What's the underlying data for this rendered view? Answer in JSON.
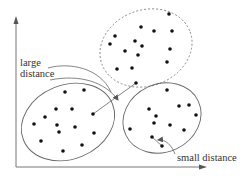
{
  "diagram": {
    "type": "clustering-distance-illustration",
    "colors": {
      "axis": "#777777",
      "ellipse": "#666666",
      "dashed_ellipse": "#888888",
      "point": "#111111",
      "text": "#333333"
    },
    "labels": {
      "large_distance_line1": "large",
      "large_distance_line2": "distance",
      "small_distance": "small distance"
    },
    "axes": {
      "origin": [
        16,
        167
      ],
      "y_end": [
        16,
        17
      ],
      "x_end": [
        206,
        167
      ]
    },
    "clusters": [
      {
        "name": "top-cluster",
        "style": "dashed",
        "ellipse": {
          "cx": 146,
          "cy": 48,
          "rx": 47,
          "ry": 38,
          "rotate": -20
        },
        "points": [
          [
            169,
            14
          ],
          [
            141,
            27
          ],
          [
            154,
            31
          ],
          [
            172,
            31
          ],
          [
            115,
            36
          ],
          [
            110,
            44
          ],
          [
            135,
            41
          ],
          [
            142,
            46
          ],
          [
            125,
            51
          ],
          [
            138,
            55
          ],
          [
            170,
            49
          ],
          [
            167,
            62
          ],
          [
            117,
            69
          ],
          [
            132,
            68
          ],
          [
            136,
            83
          ]
        ]
      },
      {
        "name": "left-cluster",
        "style": "solid",
        "ellipse": {
          "cx": 68,
          "cy": 122,
          "rx": 48,
          "ry": 37,
          "rotate": -22
        },
        "points": [
          [
            65,
            92
          ],
          [
            84,
            90
          ],
          [
            56,
            109
          ],
          [
            72,
            109
          ],
          [
            45,
            117
          ],
          [
            93,
            114
          ],
          [
            34,
            124
          ],
          [
            57,
            125
          ],
          [
            75,
            127
          ],
          [
            59,
            132
          ],
          [
            94,
            133
          ],
          [
            41,
            141
          ],
          [
            82,
            145
          ],
          [
            63,
            151
          ]
        ]
      },
      {
        "name": "right-cluster",
        "style": "solid",
        "ellipse": {
          "cx": 162,
          "cy": 118,
          "rx": 40,
          "ry": 34,
          "rotate": -25
        },
        "points": [
          [
            167,
            90
          ],
          [
            189,
            105
          ],
          [
            179,
            106
          ],
          [
            149,
            109
          ],
          [
            156,
            116
          ],
          [
            196,
            115
          ],
          [
            154,
            123
          ],
          [
            170,
            125
          ],
          [
            130,
            129
          ],
          [
            184,
            130
          ],
          [
            152,
            137
          ],
          [
            162,
            146
          ]
        ]
      }
    ],
    "connectors": {
      "large_distance_line": [
        [
          93,
          114
        ],
        [
          136,
          83
        ]
      ],
      "small_distance_line": [
        [
          152,
          137
        ],
        [
          162,
          146
        ]
      ]
    }
  }
}
